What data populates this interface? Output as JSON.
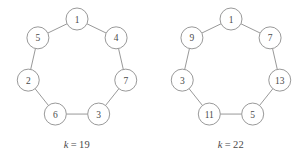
{
  "figures": [
    {
      "id": "left",
      "caption": {
        "variable": "k",
        "operator": "=",
        "value": "19",
        "full": "k = 19"
      },
      "graph": {
        "type": "cycle",
        "node_count": 7,
        "nodes": [
          {
            "label": "1",
            "position": "top"
          },
          {
            "label": "4",
            "position": "upper-right"
          },
          {
            "label": "7",
            "position": "right"
          },
          {
            "label": "3",
            "position": "lower-right"
          },
          {
            "label": "6",
            "position": "lower-left"
          },
          {
            "label": "2",
            "position": "left"
          },
          {
            "label": "5",
            "position": "upper-left"
          }
        ],
        "edges": [
          [
            0,
            1
          ],
          [
            1,
            2
          ],
          [
            2,
            3
          ],
          [
            3,
            4
          ],
          [
            4,
            5
          ],
          [
            5,
            6
          ],
          [
            6,
            0
          ]
        ]
      }
    },
    {
      "id": "right",
      "caption": {
        "variable": "k",
        "operator": "=",
        "value": "22",
        "full": "k = 22"
      },
      "graph": {
        "type": "cycle",
        "node_count": 7,
        "nodes": [
          {
            "label": "1",
            "position": "top"
          },
          {
            "label": "7",
            "position": "upper-right"
          },
          {
            "label": "13",
            "position": "right"
          },
          {
            "label": "5",
            "position": "lower-right"
          },
          {
            "label": "11",
            "position": "lower-left"
          },
          {
            "label": "3",
            "position": "left"
          },
          {
            "label": "9",
            "position": "upper-left"
          }
        ],
        "edges": [
          [
            0,
            1
          ],
          [
            1,
            2
          ],
          [
            2,
            3
          ],
          [
            3,
            4
          ],
          [
            4,
            5
          ],
          [
            5,
            6
          ],
          [
            6,
            0
          ]
        ]
      }
    }
  ],
  "style": {
    "stroke_color": "#8d8d8d",
    "text_color": "#4a4a4a",
    "background": "#ffffff",
    "node_radius": 11
  }
}
